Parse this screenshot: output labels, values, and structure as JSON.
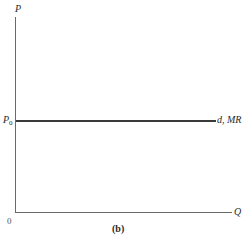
{
  "chart_data": {
    "type": "line",
    "title": "",
    "caption": "(b)",
    "xlabel": "Q",
    "ylabel": "P",
    "origin_label": "0",
    "y_tick_labels": [
      "P0"
    ],
    "grid": false,
    "legend": "none",
    "series": [
      {
        "name": "d, MR",
        "description": "Horizontal demand / marginal revenue curve at price P0",
        "x": [
          0,
          1
        ],
        "y": [
          "P0",
          "P0"
        ],
        "style": "solid horizontal line"
      }
    ],
    "annotations": [
      {
        "text": "d, MR",
        "position": "right end of horizontal line at P0"
      }
    ],
    "xlim": [
      0,
      1
    ],
    "ylim": [
      0,
      1
    ],
    "p0_relative_height": 0.47
  },
  "labels": {
    "y_axis": "P",
    "x_axis": "Q",
    "origin": "0",
    "p0_main": "P",
    "p0_sub": "0",
    "curve": "d, MR",
    "caption": "(b)"
  }
}
